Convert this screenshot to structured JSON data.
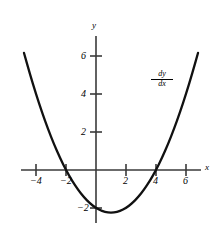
{
  "chart_data": {
    "type": "line",
    "title": "",
    "subtitle": "",
    "xlabel": "x",
    "ylabel": "y",
    "xlim": [
      -5.0,
      7.3
    ],
    "ylim": [
      -3.0,
      7.6
    ],
    "grid": false,
    "legend_position": "none",
    "x_ticks": [
      -4,
      -2,
      2,
      4,
      6
    ],
    "x_tick_labels": [
      "−4",
      "−2",
      "2",
      "4",
      "6"
    ],
    "y_ticks": [
      2,
      4,
      6,
      -2
    ],
    "y_tick_labels": [
      "2",
      "4",
      "6",
      "−2"
    ],
    "annotations": [
      {
        "name": "derivative-label",
        "numerator": "dy",
        "denominator": "dx",
        "text": "dy/dx",
        "x": 4.7,
        "y": 4.6
      }
    ],
    "series": [
      {
        "name": "dy/dx",
        "equation": "y = 0.25x^2 - 0.5x - 2",
        "roots": [
          -2,
          4
        ],
        "vertex": [
          1,
          -2.25
        ],
        "y_intercept": -2,
        "x": [
          -4.8,
          -4.4,
          -4.0,
          -3.6,
          -3.2,
          -2.8,
          -2.4,
          -2.0,
          -1.6,
          -1.2,
          -0.8,
          -0.4,
          0.0,
          0.4,
          0.8,
          1.2,
          1.6,
          2.0,
          2.4,
          2.8,
          3.2,
          3.6,
          4.0,
          4.4,
          4.8,
          5.2,
          5.6,
          6.0,
          6.4,
          6.8
        ],
        "y": [
          6.16,
          5.04,
          4.0,
          3.04,
          2.16,
          1.36,
          0.64,
          0.0,
          -0.56,
          -1.04,
          -1.44,
          -1.76,
          -2.0,
          -2.16,
          -2.24,
          -2.24,
          -2.16,
          -2.0,
          -1.76,
          -1.44,
          -1.04,
          -0.56,
          0.0,
          0.64,
          1.36,
          2.16,
          3.04,
          4.0,
          5.04,
          6.16
        ]
      }
    ],
    "colors": {
      "curve": "#000000",
      "axis": "#3a3a3a",
      "background": "#ffffff",
      "text": "#000000"
    }
  },
  "axes": {
    "x_axis_label": "x",
    "y_axis_label": "y"
  },
  "labels": {
    "x_neg4": "−4",
    "x_neg2": "−2",
    "x_2": "2",
    "x_4": "4",
    "x_6": "6",
    "y_2": "2",
    "y_4": "4",
    "y_6": "6",
    "y_neg2": "−2"
  }
}
